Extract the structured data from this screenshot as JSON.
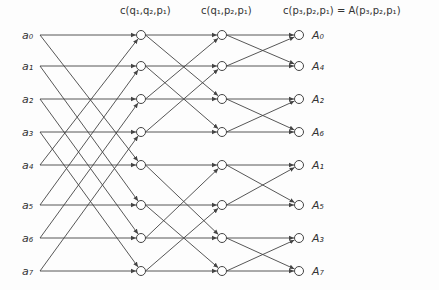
{
  "headers": {
    "stage1": "c(q₁,q₂,p₁)",
    "stage2": "c(q₁,p₂,p₁)",
    "stage3": "c(p₃,p₂,p₁) = A(p₃,p₂,p₁)"
  },
  "inputs": [
    "a₀",
    "a₁",
    "a₂",
    "a₃",
    "a₄",
    "a₅",
    "a₆",
    "a₇"
  ],
  "outputs": [
    "A₀",
    "A₄",
    "A₂",
    "A₆",
    "A₁",
    "A₅",
    "A₃",
    "A₇"
  ],
  "layout": {
    "rows_y": [
      35,
      66,
      99,
      132,
      165,
      205,
      238,
      271
    ],
    "input_x": 40,
    "columns_x": [
      141,
      222,
      299
    ],
    "node_radius": 4.5
  },
  "stages": [
    {
      "name": "stage1",
      "span": 4
    },
    {
      "name": "stage2",
      "span": 2
    },
    {
      "name": "stage3",
      "span": 1
    }
  ],
  "colors": {
    "line": "#444444",
    "text": "#333333",
    "background": "#fdfdfd"
  }
}
